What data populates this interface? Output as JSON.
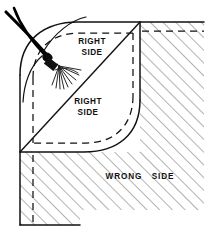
{
  "figure": {
    "labels": [
      {
        "id": "upper-right-side",
        "line1": "RIGHT",
        "line2": "SIDE",
        "x": 92,
        "y": 46
      },
      {
        "id": "lower-right-side",
        "line1": "RIGHT",
        "line2": "SIDE",
        "x": 88,
        "y": 106
      },
      {
        "id": "wrong-side",
        "line1": "WRONG",
        "line2": "SIDE",
        "x": 140,
        "y": 177
      }
    ],
    "colors": {
      "ink": "#111111",
      "hatch": "#5a5a5a",
      "paper": "#ffffff",
      "thread": "#000000"
    },
    "line_styles": {
      "solid_label": "cut / fold edge",
      "dashed_label": "stitching line",
      "hatched_label": "wrong side of fabric"
    },
    "elements": {
      "needle_label": "needle",
      "thread_label": "thread",
      "tassel_label": "thread-ends-tassel",
      "fold_diagonal_label": "diagonal fold line",
      "flap_label": "rounded corner flap"
    }
  }
}
